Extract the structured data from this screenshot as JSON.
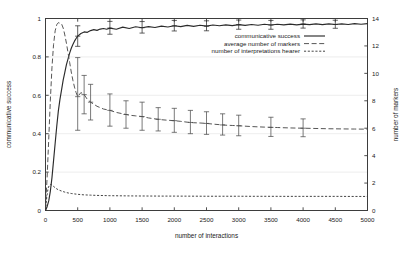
{
  "chart_data": {
    "type": "line",
    "title": "",
    "xlabel": "number of interactions",
    "ylabel": "communicative success",
    "ylabel_right": "number of markers",
    "xlim": [
      0,
      5000
    ],
    "ylim": [
      0,
      1
    ],
    "ylim_right": [
      0,
      14
    ],
    "grid": true,
    "grid_axis": "y",
    "legend_position": "upper-right-inside",
    "xticks": [
      0,
      500,
      1000,
      1500,
      2000,
      2500,
      3000,
      3500,
      4000,
      4500,
      5000
    ],
    "xticklabels": [
      "0",
      "500",
      "1000",
      "1500",
      "2000",
      "2500",
      "3000",
      "3500",
      "4000",
      "4500",
      "5000"
    ],
    "yticks": [
      0,
      0.2,
      0.4,
      0.6,
      0.8,
      1
    ],
    "yticklabels": [
      "0",
      "0.2",
      "0.4",
      "0.6",
      "0.8",
      "1"
    ],
    "yticks_right": [
      0,
      2,
      4,
      6,
      8,
      10,
      12,
      14
    ],
    "yticklabels_right": [
      "0",
      "2",
      "4",
      "6",
      "8",
      "10",
      "12",
      "14"
    ],
    "series": [
      {
        "name": "communicative success",
        "axis": "left",
        "style": "solid",
        "color": "#2b2b2b",
        "x": [
          0,
          25,
          50,
          75,
          100,
          125,
          150,
          175,
          200,
          225,
          250,
          275,
          300,
          325,
          350,
          375,
          400,
          425,
          450,
          475,
          500,
          550,
          600,
          650,
          700,
          750,
          800,
          850,
          900,
          950,
          1000,
          1100,
          1200,
          1300,
          1400,
          1500,
          1600,
          1700,
          1800,
          1900,
          2000,
          2100,
          2200,
          2300,
          2400,
          2500,
          2600,
          2700,
          2800,
          2900,
          3000,
          3100,
          3200,
          3300,
          3400,
          3500,
          3600,
          3700,
          3800,
          3900,
          4000,
          4100,
          4200,
          4300,
          4400,
          4500,
          4600,
          4700,
          4800,
          4900,
          5000
        ],
        "y": [
          0.0,
          0.02,
          0.05,
          0.1,
          0.17,
          0.26,
          0.35,
          0.44,
          0.52,
          0.58,
          0.63,
          0.68,
          0.72,
          0.76,
          0.79,
          0.82,
          0.845,
          0.865,
          0.882,
          0.896,
          0.908,
          0.922,
          0.93,
          0.928,
          0.937,
          0.942,
          0.938,
          0.945,
          0.948,
          0.944,
          0.95,
          0.944,
          0.955,
          0.948,
          0.957,
          0.952,
          0.958,
          0.953,
          0.96,
          0.956,
          0.962,
          0.958,
          0.964,
          0.959,
          0.965,
          0.96,
          0.966,
          0.962,
          0.967,
          0.963,
          0.968,
          0.964,
          0.969,
          0.965,
          0.97,
          0.966,
          0.97,
          0.967,
          0.971,
          0.967,
          0.971,
          0.968,
          0.972,
          0.968,
          0.972,
          0.969,
          0.972,
          0.969,
          0.973,
          0.97,
          0.973
        ],
        "errorbars": [
          {
            "x": 500,
            "y": 0.908,
            "lo": 0.855,
            "hi": 0.962
          },
          {
            "x": 1000,
            "y": 0.95,
            "lo": 0.918,
            "hi": 0.985
          },
          {
            "x": 1500,
            "y": 0.952,
            "lo": 0.924,
            "hi": 0.984
          },
          {
            "x": 2000,
            "y": 0.962,
            "lo": 0.935,
            "hi": 0.99
          },
          {
            "x": 2500,
            "y": 0.96,
            "lo": 0.936,
            "hi": 0.988
          },
          {
            "x": 3000,
            "y": 0.968,
            "lo": 0.944,
            "hi": 0.992
          },
          {
            "x": 3500,
            "y": 0.966,
            "lo": 0.944,
            "hi": 0.99
          },
          {
            "x": 4000,
            "y": 0.971,
            "lo": 0.95,
            "hi": 0.993
          },
          {
            "x": 4500,
            "y": 0.969,
            "lo": 0.949,
            "hi": 0.991
          }
        ]
      },
      {
        "name": "average number of markers",
        "axis": "right",
        "style": "dashed",
        "color": "#4d4d4d",
        "x": [
          0,
          25,
          50,
          75,
          100,
          125,
          150,
          175,
          200,
          225,
          250,
          275,
          300,
          325,
          350,
          375,
          400,
          425,
          450,
          475,
          500,
          550,
          600,
          650,
          700,
          750,
          800,
          850,
          900,
          950,
          1000,
          1100,
          1200,
          1300,
          1400,
          1500,
          1600,
          1700,
          1800,
          1900,
          2000,
          2100,
          2200,
          2300,
          2400,
          2500,
          2600,
          2700,
          2800,
          2900,
          3000,
          3200,
          3400,
          3600,
          3800,
          4000,
          4200,
          4400,
          4600,
          4800,
          5000
        ],
        "y": [
          0.2,
          2.4,
          5.2,
          8.0,
          10.4,
          12.1,
          13.1,
          13.55,
          13.7,
          13.65,
          13.6,
          13.3,
          12.8,
          12.2,
          11.5,
          10.8,
          10.1,
          9.5,
          9.0,
          8.6,
          8.3,
          8.6,
          8.45,
          8.1,
          7.9,
          7.75,
          7.6,
          7.5,
          7.4,
          7.35,
          7.3,
          7.15,
          7.05,
          6.95,
          6.9,
          6.85,
          6.75,
          6.68,
          6.62,
          6.58,
          6.55,
          6.5,
          6.44,
          6.4,
          6.38,
          6.35,
          6.3,
          6.26,
          6.22,
          6.2,
          6.18,
          6.12,
          6.08,
          6.05,
          6.02,
          6.0,
          5.98,
          5.96,
          5.95,
          5.94,
          5.93
        ],
        "errorbars": [
          {
            "x": 500,
            "y": 8.3,
            "lo": 5.85,
            "hi": 11.15
          },
          {
            "x": 600,
            "y": 8.45,
            "lo": 7.05,
            "hi": 9.85
          },
          {
            "x": 700,
            "y": 7.9,
            "lo": 6.6,
            "hi": 9.2
          },
          {
            "x": 1000,
            "y": 7.3,
            "lo": 6.15,
            "hi": 8.5
          },
          {
            "x": 1250,
            "y": 7.0,
            "lo": 6.0,
            "hi": 8.0
          },
          {
            "x": 1500,
            "y": 6.85,
            "lo": 5.85,
            "hi": 7.9
          },
          {
            "x": 1750,
            "y": 6.65,
            "lo": 5.8,
            "hi": 7.5
          },
          {
            "x": 2000,
            "y": 6.55,
            "lo": 5.7,
            "hi": 7.45
          },
          {
            "x": 2250,
            "y": 6.42,
            "lo": 5.6,
            "hi": 7.3
          },
          {
            "x": 2500,
            "y": 6.35,
            "lo": 5.55,
            "hi": 7.2
          },
          {
            "x": 2750,
            "y": 6.24,
            "lo": 5.5,
            "hi": 7.05
          },
          {
            "x": 3000,
            "y": 6.18,
            "lo": 5.45,
            "hi": 6.95
          },
          {
            "x": 3500,
            "y": 6.06,
            "lo": 5.4,
            "hi": 6.8
          },
          {
            "x": 4000,
            "y": 6.0,
            "lo": 5.38,
            "hi": 6.68
          }
        ]
      },
      {
        "name": "number of interpretations hearer",
        "axis": "right",
        "style": "dotted",
        "color": "#3a3a3a",
        "x": [
          0,
          20,
          40,
          60,
          80,
          100,
          120,
          150,
          180,
          220,
          260,
          300,
          350,
          400,
          450,
          500,
          600,
          700,
          800,
          900,
          1000,
          1200,
          1400,
          1600,
          1800,
          2000,
          2250,
          2500,
          2750,
          3000,
          3250,
          3500,
          3750,
          4000,
          4250,
          4500,
          4750,
          5000
        ],
        "y": [
          0.0,
          1.0,
          1.62,
          1.85,
          1.9,
          1.86,
          1.78,
          1.66,
          1.56,
          1.47,
          1.4,
          1.34,
          1.28,
          1.24,
          1.21,
          1.18,
          1.14,
          1.12,
          1.1,
          1.09,
          1.08,
          1.07,
          1.06,
          1.055,
          1.05,
          1.05,
          1.045,
          1.04,
          1.04,
          1.04,
          1.035,
          1.035,
          1.03,
          1.03,
          1.03,
          1.03,
          1.025,
          1.025
        ]
      }
    ]
  },
  "legend": {
    "items": [
      {
        "label": "communicative success",
        "style": "solid"
      },
      {
        "label": "average number of markers",
        "style": "dashed"
      },
      {
        "label": "number of interpretations hearer",
        "style": "dotted"
      }
    ]
  }
}
